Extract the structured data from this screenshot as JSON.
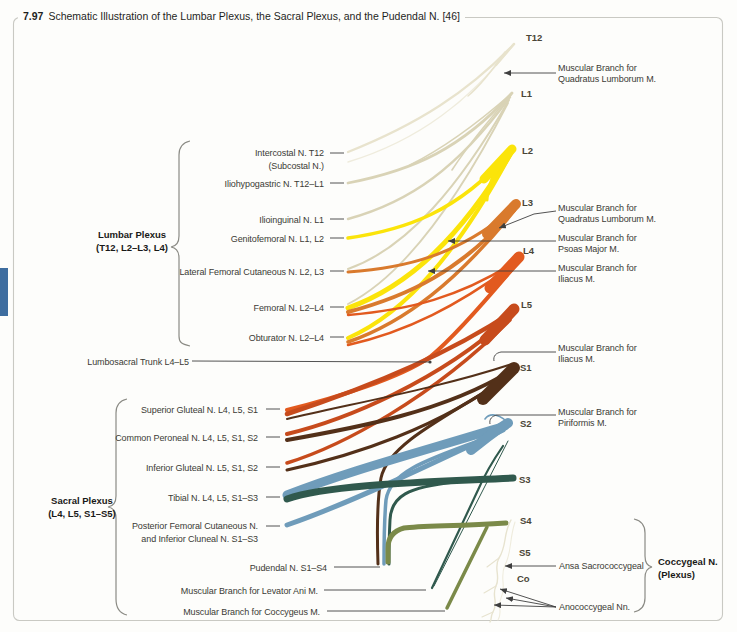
{
  "figure": {
    "number": "7.97",
    "title": "Schematic Illustration of the Lumbar Plexus, the Sacral Plexus, and the Pudendal N. [46]"
  },
  "spinal_levels": [
    "T12",
    "L1",
    "L2",
    "L3",
    "L4",
    "L5",
    "S1",
    "S2",
    "S3",
    "S4",
    "S5",
    "Co"
  ],
  "groups": {
    "lumbar": {
      "name": "Lumbar Plexus",
      "range": "(T12, L2–L3, L4)"
    },
    "sacral": {
      "name": "Sacral Plexus",
      "range": "(L4, L5, S1–S5)"
    },
    "coccygeal": {
      "name": "Coccygeal N.",
      "range": "(Plexus)"
    }
  },
  "nerve_labels": {
    "intercostal": {
      "line1": "Intercostal N. T12",
      "line2": "(Subcostal N.)"
    },
    "iliohypogastric": "Iliohypogastric N. T12–L1",
    "ilioinguinal": "Ilioinguinal N. L1",
    "genitofemoral": "Genitofemoral N. L1, L2",
    "lateral_femoral_cutaneous": "Lateral Femoral Cutaneous N. L2, L3",
    "femoral": "Femoral N. L2–L4",
    "obturator": "Obturator N. L2–L4",
    "lumbosacral_trunk": "Lumbosacral Trunk L4–L5",
    "superior_gluteal": "Superior Gluteal N. L4, L5, S1",
    "common_peroneal": "Common Peroneal N. L4, L5, S1, S2",
    "inferior_gluteal": "Inferior Gluteal N. L5, S1, S2",
    "tibial": "Tibial N. L4, L5, S1–S3",
    "posterior_femoral_cutaneous": {
      "line1": "Posterior Femoral Cutaneous N.",
      "line2": "and Inferior Cluneal N. S1–S3"
    },
    "pudendal": "Pudendal N. S1–S4",
    "levator_ani": "Muscular Branch for Levator Ani M.",
    "coccygeus": "Muscular Branch for Coccygeus M."
  },
  "muscular_branches": {
    "quadratus_lumborum_1": {
      "line1": "Muscular Branch for",
      "line2": "Quadratus Lumborum M."
    },
    "quadratus_lumborum_2": {
      "line1": "Muscular Branch for",
      "line2": "Quadratus Lumborum M."
    },
    "psoas_major": {
      "line1": "Muscular Branch for",
      "line2": "Psoas Major M."
    },
    "iliacus_1": {
      "line1": "Muscular Branch for",
      "line2": "Iliacus M."
    },
    "iliacus_2": {
      "line1": "Muscular Branch for",
      "line2": "Iliacus M."
    },
    "piriformis": {
      "line1": "Muscular Branch for",
      "line2": "Piriformis M."
    },
    "ansa_sacrococcygeal": "Ansa Sacrococcygeal",
    "anococcygeal": "Anococcygeal Nn."
  },
  "colors": {
    "t12": "#e8e3cd",
    "l1": "#d9d3b6",
    "l2": "#fbe40a",
    "l3": "#d97a2d",
    "l4": "#e25a1f",
    "l5": "#c74b1c",
    "s1": "#533019",
    "s2": "#6f9cba",
    "s3": "#30594d",
    "s4": "#7b8a49",
    "pale": "#e7e3cf",
    "pale_light": "#efecdd",
    "leader": "#3f3f3f",
    "brace": "#8b8b85",
    "frame": "#c9c9c3",
    "side_tab": "#3e6d9f"
  }
}
